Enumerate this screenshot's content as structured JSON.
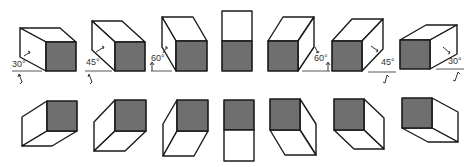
{
  "colors": {
    "shaded_face": "#6f6f6f",
    "line": "#1a1a1a",
    "background": "#ffffff"
  },
  "top_row": {
    "description": "Receding axis views looking from above, front face shaded",
    "cubes": [
      {
        "id": "top-1",
        "angle_label": "30°",
        "direction": "left"
      },
      {
        "id": "top-2",
        "angle_label": "45°",
        "direction": "left"
      },
      {
        "id": "top-3",
        "angle_label": "60°",
        "direction": "left"
      },
      {
        "id": "top-4",
        "angle_label": "",
        "direction": "center"
      },
      {
        "id": "top-5",
        "angle_label": "60°",
        "direction": "right"
      },
      {
        "id": "top-6",
        "angle_label": "45°",
        "direction": "right"
      },
      {
        "id": "top-7",
        "angle_label": "30°",
        "direction": "right"
      }
    ]
  },
  "bottom_row": {
    "description": "Receding axis views looking from below, front face shaded",
    "cubes": [
      {
        "id": "bottom-1",
        "direction": "left"
      },
      {
        "id": "bottom-2",
        "direction": "left"
      },
      {
        "id": "bottom-3",
        "direction": "left"
      },
      {
        "id": "bottom-4",
        "direction": "center"
      },
      {
        "id": "bottom-5",
        "direction": "right"
      },
      {
        "id": "bottom-6",
        "direction": "right"
      },
      {
        "id": "bottom-7",
        "direction": "right"
      }
    ]
  }
}
